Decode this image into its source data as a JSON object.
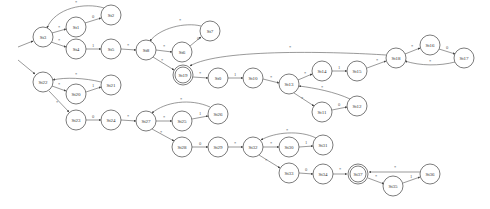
{
  "diagram": {
    "type": "state-machine",
    "node_radius": 10,
    "stroke_color": "#444444",
    "nodes": [
      {
        "id": "St3",
        "x": 43,
        "y": 37,
        "accepting": false
      },
      {
        "id": "St1",
        "x": 76,
        "y": 27,
        "accepting": false
      },
      {
        "id": "St2",
        "x": 111,
        "y": 15,
        "accepting": false
      },
      {
        "id": "St4",
        "x": 76,
        "y": 49,
        "accepting": false
      },
      {
        "id": "St5",
        "x": 111,
        "y": 49,
        "accepting": false
      },
      {
        "id": "St8",
        "x": 146,
        "y": 50,
        "accepting": false
      },
      {
        "id": "St6",
        "x": 182,
        "y": 52,
        "accepting": false
      },
      {
        "id": "St7",
        "x": 210,
        "y": 31,
        "accepting": false
      },
      {
        "id": "St19",
        "x": 183,
        "y": 75,
        "accepting": true
      },
      {
        "id": "St0",
        "x": 218,
        "y": 78,
        "accepting": false
      },
      {
        "id": "St10",
        "x": 253,
        "y": 78,
        "accepting": false
      },
      {
        "id": "St13",
        "x": 289,
        "y": 84,
        "accepting": false
      },
      {
        "id": "St14",
        "x": 322,
        "y": 71,
        "accepting": false
      },
      {
        "id": "St15",
        "x": 357,
        "y": 71,
        "accepting": false
      },
      {
        "id": "St18",
        "x": 396,
        "y": 58,
        "accepting": false
      },
      {
        "id": "St16",
        "x": 430,
        "y": 45,
        "accepting": false
      },
      {
        "id": "St17",
        "x": 464,
        "y": 58,
        "accepting": false
      },
      {
        "id": "St11",
        "x": 322,
        "y": 112,
        "accepting": false
      },
      {
        "id": "St12",
        "x": 357,
        "y": 106,
        "accepting": false
      },
      {
        "id": "St22",
        "x": 43,
        "y": 82,
        "accepting": false
      },
      {
        "id": "St20",
        "x": 76,
        "y": 94,
        "accepting": false
      },
      {
        "id": "St21",
        "x": 111,
        "y": 85,
        "accepting": false
      },
      {
        "id": "St23",
        "x": 76,
        "y": 120,
        "accepting": false
      },
      {
        "id": "St24",
        "x": 111,
        "y": 120,
        "accepting": false
      },
      {
        "id": "St27",
        "x": 146,
        "y": 121,
        "accepting": false
      },
      {
        "id": "St25",
        "x": 182,
        "y": 121,
        "accepting": false
      },
      {
        "id": "St26",
        "x": 218,
        "y": 114,
        "accepting": false
      },
      {
        "id": "St28",
        "x": 182,
        "y": 147,
        "accepting": false
      },
      {
        "id": "St29",
        "x": 218,
        "y": 147,
        "accepting": false
      },
      {
        "id": "St32",
        "x": 253,
        "y": 147,
        "accepting": false
      },
      {
        "id": "St30",
        "x": 289,
        "y": 147,
        "accepting": false
      },
      {
        "id": "St31",
        "x": 323,
        "y": 145,
        "accepting": false
      },
      {
        "id": "St33",
        "x": 289,
        "y": 173,
        "accepting": false
      },
      {
        "id": "St34",
        "x": 323,
        "y": 174,
        "accepting": false
      },
      {
        "id": "St37",
        "x": 358,
        "y": 174,
        "accepting": true
      },
      {
        "id": "St35",
        "x": 393,
        "y": 186,
        "accepting": false
      },
      {
        "id": "St36",
        "x": 430,
        "y": 174,
        "accepting": false
      }
    ],
    "edges": [
      {
        "from": "start",
        "to": "St3",
        "label": "",
        "path": "M18,47 L33,41",
        "lx": 0,
        "ly": 0
      },
      {
        "from": "start",
        "to": "St22",
        "label": "",
        "path": "M18,60 L35,74",
        "lx": 0,
        "ly": 0
      },
      {
        "from": "St3",
        "to": "St1",
        "label": "*",
        "path": "M52,33 L66,29",
        "lx": 59,
        "ly": 29
      },
      {
        "from": "St1",
        "to": "St2",
        "label": "0",
        "path": "M85,23 L101,18",
        "lx": 93,
        "ly": 18
      },
      {
        "from": "St2",
        "to": "St3",
        "label": "*",
        "path": "M104,8 C85,2 55,8 47,28",
        "lx": 76,
        "ly": 4
      },
      {
        "from": "St3",
        "to": "St4",
        "label": "*",
        "path": "M51,42 L66,47",
        "lx": 59,
        "ly": 42
      },
      {
        "from": "St4",
        "to": "St5",
        "label": "1",
        "path": "M86,49 L101,49",
        "lx": 93,
        "ly": 47
      },
      {
        "from": "St5",
        "to": "St8",
        "label": "*",
        "path": "M121,49 L136,50",
        "lx": 128,
        "ly": 47
      },
      {
        "from": "St8",
        "to": "St6",
        "label": "*",
        "path": "M156,50 L172,52",
        "lx": 164,
        "ly": 48
      },
      {
        "from": "St6",
        "to": "St7",
        "label": "0",
        "path": "M190,46 L201,37",
        "lx": 198,
        "ly": 40
      },
      {
        "from": "St7",
        "to": "St8",
        "label": "*",
        "path": "M201,26 C185,22 160,28 150,41",
        "lx": 180,
        "ly": 22
      },
      {
        "from": "St8",
        "to": "St19",
        "label": "*",
        "path": "M153,57 L174,70",
        "lx": 162,
        "ly": 62
      },
      {
        "from": "St18",
        "to": "St19",
        "label": "*",
        "path": "M386,55 C340,52 220,48 190,66",
        "lx": 290,
        "ly": 49
      },
      {
        "from": "St19",
        "to": "St0",
        "label": "*",
        "path": "M193,77 L208,78",
        "lx": 200,
        "ly": 75
      },
      {
        "from": "St0",
        "to": "St10",
        "label": "1",
        "path": "M228,78 L243,78",
        "lx": 235,
        "ly": 76
      },
      {
        "from": "St10",
        "to": "St13",
        "label": "*",
        "path": "M263,79 L279,83",
        "lx": 271,
        "ly": 79
      },
      {
        "from": "St13",
        "to": "St14",
        "label": "*",
        "path": "M298,80 L312,74",
        "lx": 305,
        "ly": 75
      },
      {
        "from": "St14",
        "to": "St15",
        "label": "1",
        "path": "M332,71 L347,71",
        "lx": 339,
        "ly": 69
      },
      {
        "from": "St15",
        "to": "St18",
        "label": "*",
        "path": "M367,68 L386,61",
        "lx": 377,
        "ly": 62
      },
      {
        "from": "St18",
        "to": "St16",
        "label": "*",
        "path": "M405,54 L420,48",
        "lx": 412,
        "ly": 48
      },
      {
        "from": "St16",
        "to": "St17",
        "label": "0",
        "path": "M439,49 L455,54",
        "lx": 447,
        "ly": 49
      },
      {
        "from": "St17",
        "to": "St18",
        "label": "*",
        "path": "M455,62 C440,66 420,66 405,61",
        "lx": 430,
        "ly": 63
      },
      {
        "from": "St13",
        "to": "St11",
        "label": "*",
        "path": "M294,93 L314,106",
        "lx": 302,
        "ly": 100
      },
      {
        "from": "St11",
        "to": "St12",
        "label": "0",
        "path": "M332,110 L347,107",
        "lx": 339,
        "ly": 106
      },
      {
        "from": "St12",
        "to": "St13",
        "label": "*",
        "path": "M350,99 C335,92 315,88 299,86",
        "lx": 322,
        "ly": 89
      },
      {
        "from": "St22",
        "to": "St20",
        "label": "*",
        "path": "M52,86 L66,91",
        "lx": 59,
        "ly": 86
      },
      {
        "from": "St20",
        "to": "St21",
        "label": "1",
        "path": "M86,92 L101,87",
        "lx": 93,
        "ly": 87
      },
      {
        "from": "St21",
        "to": "St22",
        "label": "*",
        "path": "M101,82 C85,78 65,77 53,80",
        "lx": 76,
        "ly": 76
      },
      {
        "from": "St22",
        "to": "St23",
        "label": "*",
        "path": "M49,91 L69,112",
        "lx": 57,
        "ly": 104
      },
      {
        "from": "St23",
        "to": "St24",
        "label": "0",
        "path": "M86,120 L101,120",
        "lx": 93,
        "ly": 118
      },
      {
        "from": "St24",
        "to": "St27",
        "label": "*",
        "path": "M121,120 L136,121",
        "lx": 128,
        "ly": 118
      },
      {
        "from": "St27",
        "to": "St25",
        "label": "*",
        "path": "M156,121 L172,121",
        "lx": 164,
        "ly": 119
      },
      {
        "from": "St25",
        "to": "St26",
        "label": "1",
        "path": "M192,119 L208,116",
        "lx": 200,
        "ly": 115
      },
      {
        "from": "St26",
        "to": "St27",
        "label": "*",
        "path": "M210,107 C190,98 165,102 152,113",
        "lx": 181,
        "ly": 101
      },
      {
        "from": "St27",
        "to": "St28",
        "label": "*",
        "path": "M152,129 L174,141",
        "lx": 161,
        "ly": 134
      },
      {
        "from": "St28",
        "to": "St29",
        "label": "0",
        "path": "M192,147 L208,147",
        "lx": 200,
        "ly": 145
      },
      {
        "from": "St29",
        "to": "St32",
        "label": "*",
        "path": "M228,147 L243,147",
        "lx": 235,
        "ly": 145
      },
      {
        "from": "St32",
        "to": "St30",
        "label": "*",
        "path": "M263,147 L279,147",
        "lx": 271,
        "ly": 145
      },
      {
        "from": "St30",
        "to": "St31",
        "label": "1",
        "path": "M299,147 L313,146",
        "lx": 306,
        "ly": 144
      },
      {
        "from": "St31",
        "to": "St32",
        "label": "*",
        "path": "M316,138 C300,130 275,132 261,140",
        "lx": 287,
        "ly": 132
      },
      {
        "from": "St32",
        "to": "St33",
        "label": "*",
        "path": "M259,155 L280,168",
        "lx": 266,
        "ly": 162
      },
      {
        "from": "St33",
        "to": "St34",
        "label": "0",
        "path": "M299,173 L313,174",
        "lx": 306,
        "ly": 171
      },
      {
        "from": "St34",
        "to": "St37",
        "label": "*",
        "path": "M333,174 L347,174",
        "lx": 340,
        "ly": 171
      },
      {
        "from": "St37",
        "to": "St35",
        "label": "*",
        "path": "M368,178 L384,184",
        "lx": 376,
        "ly": 178
      },
      {
        "from": "St35",
        "to": "St36",
        "label": "1",
        "path": "M403,183 L420,177",
        "lx": 411,
        "ly": 178
      },
      {
        "from": "St36",
        "to": "St37",
        "label": "*",
        "path": "M420,172 L369,172",
        "lx": 395,
        "ly": 169
      }
    ]
  }
}
